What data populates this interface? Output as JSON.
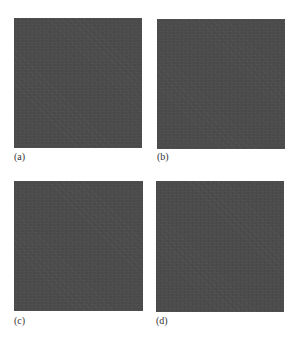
{
  "figure": {
    "panels": [
      {
        "id": "a",
        "label": "(a)",
        "fill_color": "#4b4b4b"
      },
      {
        "id": "b",
        "label": "(b)",
        "fill_color": "#4b4b4b"
      },
      {
        "id": "c",
        "label": "(c)",
        "fill_color": "#4b4b4b"
      },
      {
        "id": "d",
        "label": "(d)",
        "fill_color": "#4b4b4b"
      }
    ]
  }
}
